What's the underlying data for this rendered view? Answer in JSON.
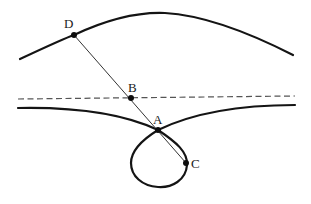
{
  "diagram": {
    "type": "geometric-figure",
    "points": [
      {
        "label": "D",
        "x": 74,
        "y": 35,
        "label_x": 64,
        "label_y": 28
      },
      {
        "label": "B",
        "x": 131,
        "y": 98,
        "label_x": 128,
        "label_y": 92
      },
      {
        "label": "A",
        "x": 158,
        "y": 130,
        "label_x": 153,
        "label_y": 123
      },
      {
        "label": "C",
        "x": 186,
        "y": 163,
        "label_x": 191,
        "label_y": 168
      }
    ],
    "upper_curve": {
      "description": "upper arched curve through D"
    },
    "dashed_line": {
      "description": "horizontal dashed line through B"
    },
    "lower_curve": {
      "description": "lower curve with a loop at A passing through C"
    },
    "segment": {
      "description": "straight line from D through B and A to C"
    },
    "colors": {
      "stroke": "#141414",
      "dashed": "#555555",
      "background": "#ffffff"
    }
  }
}
